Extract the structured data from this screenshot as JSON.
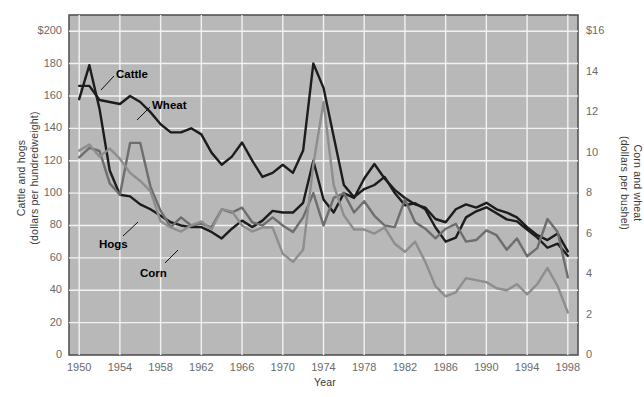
{
  "chart_data": {
    "type": "line",
    "title": "",
    "xlabel": "Year",
    "ylabel_left": "Cattle and hogs\n(dollars per hundredweight)",
    "ylabel_right": "Corn and wheat\n(dollars per bushel)",
    "ylabel_left_line1": "Cattle and hogs",
    "ylabel_left_line2": "(dollars per hundredweight)",
    "ylabel_right_line1": "Corn and wheat",
    "ylabel_right_line2": "(dollars per bushel)",
    "grid": true,
    "legend_position": "inline-annotations",
    "plot_background": "#b8b8b8",
    "xlim": [
      1949,
      1999
    ],
    "x_ticks": [
      1950,
      1954,
      1958,
      1962,
      1966,
      1970,
      1974,
      1978,
      1982,
      1986,
      1990,
      1994,
      1998
    ],
    "x_tick_labels": [
      "1950",
      "1954",
      "1958",
      "1962",
      "1966",
      "1970",
      "1974",
      "1978",
      "1982",
      "1986",
      "1990",
      "1994",
      "1998"
    ],
    "ylim_left": [
      0,
      210
    ],
    "y_ticks_left": [
      0,
      20,
      40,
      60,
      80,
      100,
      120,
      140,
      160,
      180,
      200
    ],
    "y_tick_labels_left": [
      "0",
      "20",
      "40",
      "60",
      "80",
      "100",
      "120",
      "140",
      "160",
      "180",
      "$200"
    ],
    "ylim_right": [
      0,
      16.8
    ],
    "y_ticks_right": [
      0,
      2,
      4,
      6,
      8,
      10,
      12,
      14,
      16
    ],
    "y_tick_labels_right": [
      "0",
      "2",
      "4",
      "6",
      "8",
      "10",
      "12",
      "14",
      "$16"
    ],
    "x": [
      1950,
      1951,
      1952,
      1953,
      1954,
      1955,
      1956,
      1957,
      1958,
      1959,
      1960,
      1961,
      1962,
      1963,
      1964,
      1965,
      1966,
      1967,
      1968,
      1969,
      1970,
      1971,
      1972,
      1973,
      1974,
      1975,
      1976,
      1977,
      1978,
      1979,
      1980,
      1981,
      1982,
      1983,
      1984,
      1985,
      1986,
      1987,
      1988,
      1989,
      1990,
      1991,
      1992,
      1993,
      1994,
      1995,
      1996,
      1997,
      1998
    ],
    "series": [
      {
        "name": "Cattle",
        "axis": "left",
        "color": "#1c1c1c",
        "width": 2.4,
        "units": "dollars per hundredweight",
        "values": [
          158,
          179,
          152,
          114,
          99,
          98,
          93,
          90,
          86,
          82,
          80,
          79,
          79,
          76,
          72,
          78,
          83,
          79,
          83,
          89,
          88,
          88,
          94,
          120,
          96,
          88,
          100,
          97,
          109,
          118,
          109,
          102,
          97,
          93,
          91,
          84,
          82,
          90,
          93,
          91,
          94,
          90,
          88,
          85,
          79,
          74,
          71,
          75,
          64
        ]
      },
      {
        "name": "Wheat",
        "axis": "right",
        "color": "#1c1c1c",
        "width": 2.4,
        "units": "dollars per bushel",
        "values": [
          13.3,
          13.3,
          12.6,
          12.5,
          12.4,
          12.8,
          12.5,
          12.0,
          11.4,
          11.0,
          11.0,
          11.2,
          10.9,
          10.0,
          9.4,
          9.8,
          10.5,
          9.6,
          8.8,
          9.0,
          9.4,
          9.0,
          10.1,
          14.4,
          13.2,
          10.8,
          8.4,
          7.8,
          8.2,
          8.4,
          8.8,
          8.0,
          7.4,
          7.5,
          7.2,
          6.3,
          5.6,
          5.8,
          6.8,
          7.1,
          7.3,
          7.0,
          6.7,
          6.6,
          6.2,
          5.8,
          5.3,
          5.5,
          4.9
        ]
      },
      {
        "name": "Hogs",
        "axis": "left",
        "color": "#6e6e6e",
        "width": 2.4,
        "units": "dollars per hundredweight",
        "values": [
          122,
          128,
          126,
          106,
          99,
          131,
          131,
          104,
          89,
          79,
          85,
          80,
          81,
          79,
          90,
          88,
          91,
          82,
          80,
          85,
          80,
          76,
          85,
          100,
          80,
          97,
          100,
          88,
          95,
          86,
          80,
          79,
          96,
          82,
          78,
          72,
          78,
          81,
          70,
          71,
          77,
          74,
          65,
          72,
          61,
          66,
          84,
          76,
          48
        ]
      },
      {
        "name": "Corn",
        "axis": "right",
        "color": "#8e8e8e",
        "width": 2.4,
        "units": "dollars per bushel",
        "values": [
          10.1,
          10.4,
          9.8,
          10.2,
          9.7,
          9.0,
          8.6,
          8.1,
          6.6,
          6.3,
          6.1,
          6.4,
          6.6,
          6.2,
          7.2,
          7.1,
          6.4,
          6.1,
          6.3,
          6.3,
          5.0,
          4.6,
          5.2,
          9.4,
          12.5,
          8.4,
          6.9,
          6.2,
          6.2,
          6.0,
          6.3,
          5.5,
          5.1,
          5.6,
          4.6,
          3.4,
          2.9,
          3.1,
          3.8,
          3.7,
          3.6,
          3.3,
          3.2,
          3.5,
          3.0,
          3.5,
          4.3,
          3.4,
          2.1
        ]
      }
    ],
    "annotations": [
      {
        "label": "Cattle",
        "x_px": 116,
        "y_px": 68,
        "leader_from_x": 114,
        "leader_from_y": 76,
        "leader_to_x": 101,
        "leader_to_y": 90
      },
      {
        "label": "Wheat",
        "x_px": 152,
        "y_px": 99,
        "leader_from_x": 150,
        "leader_from_y": 107,
        "leader_to_x": 137,
        "leader_to_y": 120
      },
      {
        "label": "Hogs",
        "x_px": 99,
        "y_px": 238,
        "leader_from_x": 123,
        "leader_from_y": 236,
        "leader_to_x": 138,
        "leader_to_y": 222
      },
      {
        "label": "Corn",
        "x_px": 140,
        "y_px": 267,
        "leader_from_x": 165,
        "leader_from_y": 263,
        "leader_to_x": 178,
        "leader_to_y": 250
      }
    ]
  },
  "plot": {
    "left_px": 69,
    "top_px": 15,
    "right_px": 578,
    "bottom_px": 355
  }
}
